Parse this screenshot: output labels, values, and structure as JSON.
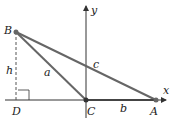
{
  "diagram": {
    "axes": {
      "x_label": "x",
      "y_label": "y"
    },
    "points": {
      "A": {
        "label": "A",
        "x": 156,
        "y": 100
      },
      "B": {
        "label": "B",
        "x": 16,
        "y": 32
      },
      "C": {
        "label": "C",
        "x": 86,
        "y": 100
      },
      "D": {
        "label": "D",
        "x": 16,
        "y": 100
      }
    },
    "sides": {
      "a": "a",
      "b": "b",
      "c": "c",
      "h": "h"
    },
    "colors": {
      "line": "#555555",
      "axis": "#333333",
      "text": "#222222"
    }
  }
}
